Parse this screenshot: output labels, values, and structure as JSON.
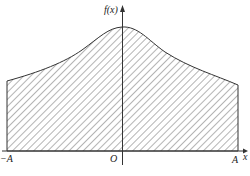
{
  "labels": {
    "y_axis": "f(x)",
    "x_axis": "x",
    "origin": "O",
    "left_bound": "−A",
    "right_bound": "A"
  },
  "colors": {
    "stroke": "#333333",
    "background": "#ffffff"
  },
  "shading": "diagonal hatch"
}
